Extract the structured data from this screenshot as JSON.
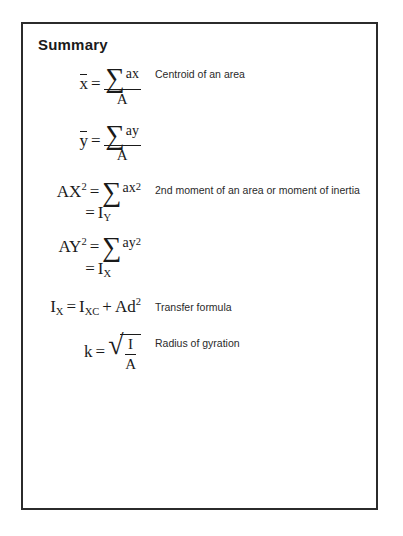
{
  "document": {
    "title": "Summary"
  },
  "formulas": [
    {
      "id": "centroid-x",
      "lhs": "x",
      "lhs_overbar": true,
      "numerator_symbol": "∑",
      "numerator_arg": "ax",
      "denominator": "A",
      "description": "Centroid of an area"
    },
    {
      "id": "centroid-y",
      "lhs": "y",
      "lhs_overbar": true,
      "numerator_symbol": "∑",
      "numerator_arg": "ay",
      "denominator": "A",
      "description": ""
    },
    {
      "id": "second-moment-y",
      "lhs_base": "AX",
      "lhs_exp": "2",
      "sum_symbol": "∑",
      "sum_base": "ax",
      "sum_exp": "2",
      "second_line_base": "I",
      "second_line_sub": "Y",
      "description": "2nd moment of an area or moment of inertia"
    },
    {
      "id": "second-moment-x",
      "lhs_base": "AY",
      "lhs_exp": "2",
      "sum_symbol": "∑",
      "sum_base": "ay",
      "sum_exp": "2",
      "second_line_base": "I",
      "second_line_sub": "X",
      "description": ""
    },
    {
      "id": "transfer-formula",
      "lhs_base": "I",
      "lhs_sub": "X",
      "rhs_base": "I",
      "rhs_sub": "XC",
      "plus": "+",
      "term_base": "Ad",
      "term_exp": "2",
      "description": "Transfer formula"
    },
    {
      "id": "radius-of-gyration",
      "lhs": "k",
      "radical": "√",
      "numerator": "I",
      "denominator": "A",
      "description": "Radius of gyration"
    }
  ],
  "symbols": {
    "equals": "=",
    "sigma": "∑",
    "radical": "√"
  },
  "colors": {
    "border": "#2b2b2b",
    "text": "#1a1a1a",
    "background": "#ffffff"
  }
}
